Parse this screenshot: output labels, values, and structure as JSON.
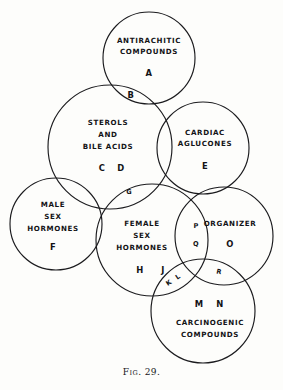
{
  "figure": {
    "caption_prefix": "F",
    "caption_small": "IG",
    "caption_number": ". 29.",
    "caption_full": "FIG. 29.",
    "type": "venn-diagram",
    "background_color": "#fdfdfb",
    "stroke_color": "#1b1b1e"
  },
  "sets": [
    {
      "id": "antirachitic",
      "name": "ANTIRACHITIC COMPOUNDS",
      "line1": "ANTIRACHITIC",
      "line2": "COMPOUNDS",
      "code": "A",
      "cx": 149,
      "cy": 58,
      "r": 46
    },
    {
      "id": "sterols",
      "name": "STEROLS AND BILE ACIDS",
      "line1": "STEROLS",
      "line2": "AND",
      "line3": "BILE ACIDS",
      "code": "C  D",
      "cx": 110,
      "cy": 147,
      "r": 62
    },
    {
      "id": "cardiac",
      "name": "CARDIAC AGLUCONES",
      "line1": "CARDIAC",
      "line2": "AGLUCONES",
      "code": "E",
      "cx": 203,
      "cy": 148,
      "r": 46
    },
    {
      "id": "male",
      "name": "MALE SEX HORMONES",
      "line1": "MALE",
      "line2": "SEX",
      "line3": "HORMONES",
      "code": "F",
      "cx": 56,
      "cy": 224,
      "r": 46
    },
    {
      "id": "female",
      "name": "FEMALE SEX HORMONES",
      "line1": "FEMALE",
      "line2": "SEX",
      "line3": "HORMONES",
      "code": "H  J",
      "cx": 152,
      "cy": 240,
      "r": 56
    },
    {
      "id": "organizer",
      "name": "ORGANIZER",
      "line1": "ORGANIZER",
      "code": "O",
      "cx": 224,
      "cy": 236,
      "r": 49
    },
    {
      "id": "carcinogenic",
      "name": "CARCINOGENIC COMPOUNDS",
      "line1": "CARCINOGENIC",
      "line2": "COMPOUNDS",
      "code": "M  N",
      "cx": 203,
      "cy": 311,
      "r": 52
    }
  ],
  "intersections": [
    {
      "id": "b",
      "code": "B",
      "between": [
        "antirachitic",
        "sterols"
      ],
      "x": 131,
      "y": 95
    },
    {
      "id": "g",
      "code": "G",
      "between": [
        "sterols",
        "female"
      ],
      "x": 129,
      "y": 192
    },
    {
      "id": "pq_p",
      "code": "P",
      "between": [
        "female",
        "organizer"
      ],
      "x": 196,
      "y": 225
    },
    {
      "id": "pq_q",
      "code": "Q",
      "between": [
        "female",
        "organizer"
      ],
      "x": 196,
      "y": 243
    },
    {
      "id": "kl",
      "code": "K L",
      "between": [
        "female",
        "carcinogenic"
      ],
      "x": 173,
      "y": 281
    },
    {
      "id": "r",
      "code": "R",
      "between": [
        "organizer",
        "carcinogenic"
      ],
      "x": 218,
      "y": 273
    }
  ],
  "labels": {
    "antirachitic_line1": "ANTIRACHITIC",
    "antirachitic_line2": "COMPOUNDS",
    "antirachitic_code": "A",
    "sterols_line1": "STEROLS",
    "sterols_line2": "AND",
    "sterols_line3": "BILE ACIDS",
    "sterols_code_c": "C",
    "sterols_code_d": "D",
    "cardiac_line1": "CARDIAC",
    "cardiac_line2": "AGLUCONES",
    "cardiac_code": "E",
    "male_line1": "MALE",
    "male_line2": "SEX",
    "male_line3": "HORMONES",
    "male_code": "F",
    "female_line1": "FEMALE",
    "female_line2": "SEX",
    "female_line3": "HORMONES",
    "female_code_h": "H",
    "female_code_j": "J",
    "organizer_line1": "ORGANIZER",
    "organizer_code": "O",
    "carcinogenic_line1": "CARCINOGENIC",
    "carcinogenic_line2": "COMPOUNDS",
    "carcinogenic_code_m": "M",
    "carcinogenic_code_n": "N",
    "inter_b": "B",
    "inter_g": "G",
    "inter_p": "P",
    "inter_q": "Q",
    "inter_k": "K",
    "inter_l": "L",
    "inter_r": "R"
  }
}
